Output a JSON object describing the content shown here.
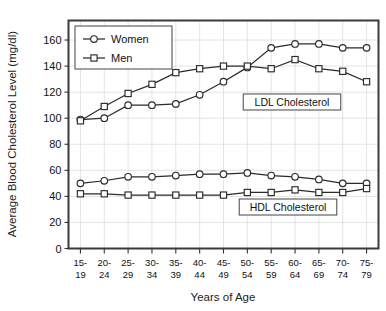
{
  "chart_data": {
    "type": "line",
    "title": "",
    "xlabel": "Years of Age",
    "ylabel": "Average Blood Cholesterol Level (mg/dl)",
    "ylim": [
      0,
      175
    ],
    "yticks": [
      0,
      20,
      40,
      60,
      80,
      100,
      120,
      140,
      160
    ],
    "grid": true,
    "legend_position": "top-left",
    "categories": [
      "15-19",
      "20-24",
      "25-29",
      "30-34",
      "35-39",
      "40-44",
      "45-49",
      "50-54",
      "55-59",
      "60-64",
      "65-69",
      "70-74",
      "75-79"
    ],
    "category_lines": [
      [
        "15-",
        "19"
      ],
      [
        "20-",
        "24"
      ],
      [
        "25-",
        "29"
      ],
      [
        "30-",
        "34"
      ],
      [
        "35-",
        "39"
      ],
      [
        "40-",
        "44"
      ],
      [
        "45-",
        "49"
      ],
      [
        "50-",
        "54"
      ],
      [
        "55-",
        "59"
      ],
      [
        "60-",
        "64"
      ],
      [
        "65-",
        "69"
      ],
      [
        "70-",
        "74"
      ],
      [
        "75-",
        "79"
      ]
    ],
    "groups": [
      {
        "name": "LDL Cholesterol",
        "annotation": "LDL Cholesterol",
        "series": [
          {
            "name": "Women",
            "marker": "circle",
            "values": [
              99,
              100,
              110,
              110,
              111,
              118,
              128,
              139,
              154,
              157,
              157,
              154,
              154
            ]
          },
          {
            "name": "Men",
            "marker": "square",
            "values": [
              98,
              109,
              119,
              126,
              135,
              138,
              140,
              140,
              138,
              145,
              138,
              136,
              128
            ]
          }
        ]
      },
      {
        "name": "HDL Cholesterol",
        "annotation": "HDL Cholesterol",
        "series": [
          {
            "name": "Women",
            "marker": "circle",
            "values": [
              50,
              52,
              55,
              55,
              56,
              57,
              57,
              58,
              56,
              55,
              53,
              50,
              50
            ]
          },
          {
            "name": "Men",
            "marker": "square",
            "values": [
              42,
              42,
              41,
              41,
              41,
              41,
              41,
              43,
              43,
              45,
              43,
              43,
              46
            ]
          }
        ]
      }
    ],
    "legend": [
      {
        "label": "Women",
        "marker": "circle"
      },
      {
        "label": "Men",
        "marker": "square"
      }
    ],
    "annotations": [
      {
        "label": "LDL Cholesterol"
      },
      {
        "label": "HDL Cholesterol"
      }
    ],
    "colors": {
      "line": "#2b2b2b",
      "marker_fill": "#ffffff",
      "frame": "#3a3a3a",
      "grid": "#d8d8d8",
      "background": "#ffffff"
    }
  }
}
